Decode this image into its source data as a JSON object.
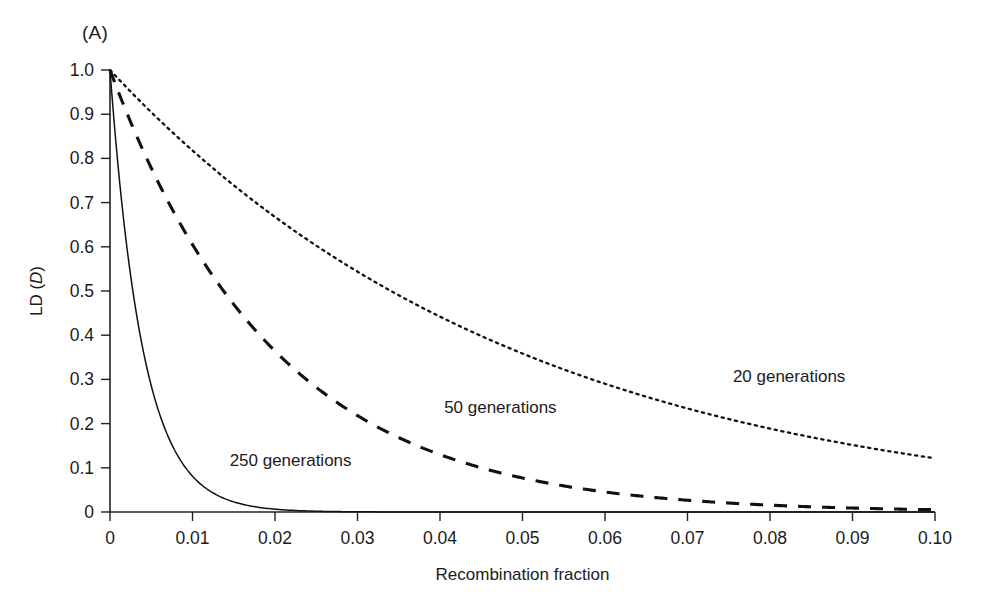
{
  "figure": {
    "panel_label": "(A)",
    "background_color": "#ffffff",
    "ink_color": "#111111"
  },
  "chart_data": {
    "type": "line",
    "title": "",
    "subtitle": "",
    "xlabel": "Recombination fraction",
    "ylabel": "LD (D)",
    "ylabel_parts": {
      "prefix": "LD (",
      "italic": "D",
      "suffix": ")"
    },
    "xlim": [
      0,
      0.1
    ],
    "ylim": [
      0,
      1.0
    ],
    "xticks": [
      0,
      0.01,
      0.02,
      0.03,
      0.04,
      0.05,
      0.06,
      0.07,
      0.08,
      0.09,
      0.1
    ],
    "xtick_labels": [
      "0",
      "0.01",
      "0.02",
      "0.03",
      "0.04",
      "0.05",
      "0.06",
      "0.07",
      "0.08",
      "0.09",
      "0.10"
    ],
    "yticks": [
      0,
      0.1,
      0.2,
      0.3,
      0.4,
      0.5,
      0.6,
      0.7,
      0.8,
      0.9,
      1.0
    ],
    "ytick_labels": [
      "0",
      "0.1",
      "0.2",
      "0.3",
      "0.4",
      "0.5",
      "0.6",
      "0.7",
      "0.8",
      "0.9",
      "1.0"
    ],
    "grid": false,
    "legend_position": "inline-annotations",
    "model": "D = (1 - c)^t",
    "x": [
      0,
      0.0025,
      0.005,
      0.0075,
      0.01,
      0.0125,
      0.015,
      0.0175,
      0.02,
      0.025,
      0.03,
      0.035,
      0.04,
      0.045,
      0.05,
      0.055,
      0.06,
      0.065,
      0.07,
      0.075,
      0.08,
      0.085,
      0.09,
      0.095,
      0.1
    ],
    "series": [
      {
        "name": "20 generations",
        "label": "20 generations",
        "generations": 20,
        "style": "dotted",
        "label_x": 0.0755,
        "label_y": 0.295,
        "values": [
          1.0,
          0.951,
          0.904,
          0.86,
          0.818,
          0.778,
          0.739,
          0.703,
          0.668,
          0.603,
          0.544,
          0.49,
          0.442,
          0.398,
          0.358,
          0.322,
          0.29,
          0.26,
          0.234,
          0.21,
          0.189,
          0.169,
          0.152,
          0.136,
          0.122
        ]
      },
      {
        "name": "50 generations",
        "label": "50 generations",
        "generations": 50,
        "style": "dashed",
        "label_x": 0.0405,
        "label_y": 0.225,
        "values": [
          1.0,
          0.882,
          0.778,
          0.686,
          0.605,
          0.534,
          0.47,
          0.414,
          0.364,
          0.282,
          0.218,
          0.168,
          0.13,
          0.1,
          0.077,
          0.059,
          0.045,
          0.035,
          0.027,
          0.02,
          0.015,
          0.012,
          0.009,
          0.007,
          0.005
        ]
      },
      {
        "name": "250 generations",
        "label": "250 generations",
        "generations": 250,
        "style": "solid",
        "label_x": 0.0145,
        "label_y": 0.105,
        "values": [
          1.0,
          0.535,
          0.285,
          0.152,
          0.081,
          0.043,
          0.023,
          0.012,
          0.0065,
          0.0018,
          0.0005,
          0.0001,
          0.0,
          0.0,
          0.0,
          0.0,
          0.0,
          0.0,
          0.0,
          0.0,
          0.0,
          0.0,
          0.0,
          0.0,
          0.0
        ]
      }
    ]
  }
}
